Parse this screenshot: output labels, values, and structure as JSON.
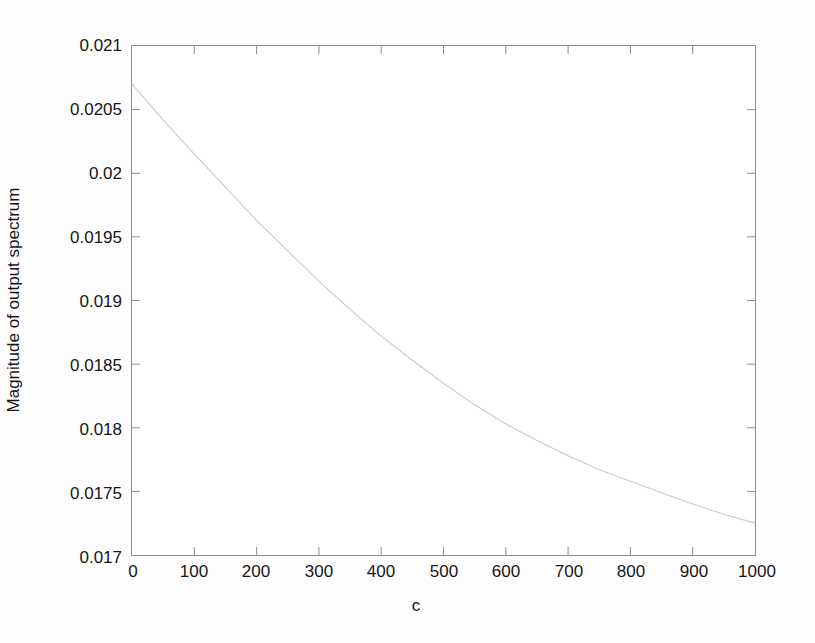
{
  "figure": {
    "background_color": "#fdfdfd",
    "plot_background_color": "#ffffff",
    "axis_color": "#8d8d8d",
    "line_color": "#c9c9c9",
    "text_color": "#161616"
  },
  "chart_data": {
    "type": "line",
    "title": "",
    "xlabel": "c",
    "ylabel": "Magnitude of output spectrum",
    "xlim": [
      0,
      1000
    ],
    "ylim": [
      0.017,
      0.021
    ],
    "grid": false,
    "legend": null,
    "xticks": [
      0,
      100,
      200,
      300,
      400,
      500,
      600,
      700,
      800,
      900,
      1000
    ],
    "xtick_labels": [
      "0",
      "100",
      "200",
      "300",
      "400",
      "500",
      "600",
      "700",
      "800",
      "900",
      "1000"
    ],
    "yticks": [
      0.017,
      0.0175,
      0.018,
      0.0185,
      0.019,
      0.0195,
      0.02,
      0.0205,
      0.021
    ],
    "ytick_labels": [
      "0.017",
      "0.0175",
      "0.018",
      "0.0185",
      "0.019",
      "0.0195",
      "0.02",
      "0.0205",
      "0.021"
    ],
    "series": [
      {
        "name": "output spectrum magnitude",
        "x": [
          0,
          50,
          100,
          150,
          200,
          250,
          300,
          350,
          400,
          450,
          500,
          550,
          600,
          650,
          700,
          750,
          800,
          850,
          900,
          950,
          1000
        ],
        "values": [
          0.0207,
          0.02042,
          0.02015,
          0.01989,
          0.01963,
          0.01939,
          0.01915,
          0.01893,
          0.01872,
          0.01853,
          0.01835,
          0.01818,
          0.01803,
          0.0179,
          0.01778,
          0.01767,
          0.01758,
          0.01749,
          0.0174,
          0.01732,
          0.01725
        ]
      }
    ]
  }
}
